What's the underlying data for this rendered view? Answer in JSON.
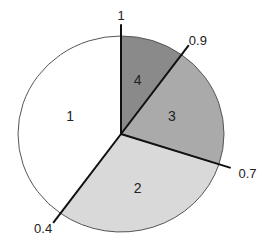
{
  "chart_data": {
    "type": "pie",
    "title": "",
    "start_angle": "12 o'clock",
    "direction": "clockwise",
    "categories": [
      "4",
      "3",
      "2",
      "1"
    ],
    "values": [
      0.1,
      0.2,
      0.3,
      0.4
    ],
    "slice_labels": [
      "4",
      "3",
      "2",
      "1"
    ],
    "boundary_labels": [
      {
        "label": "1",
        "cumulative": 1.0
      },
      {
        "label": "0.9",
        "cumulative": 0.9
      },
      {
        "label": "0.7",
        "cumulative": 0.7
      },
      {
        "label": "0.4",
        "cumulative": 0.4
      }
    ],
    "colors": {
      "4": "#8a8a8a",
      "3": "#aaaaaa",
      "2": "#d9d9d9",
      "1": "#ffffff"
    },
    "legend": "none",
    "grid": false
  }
}
